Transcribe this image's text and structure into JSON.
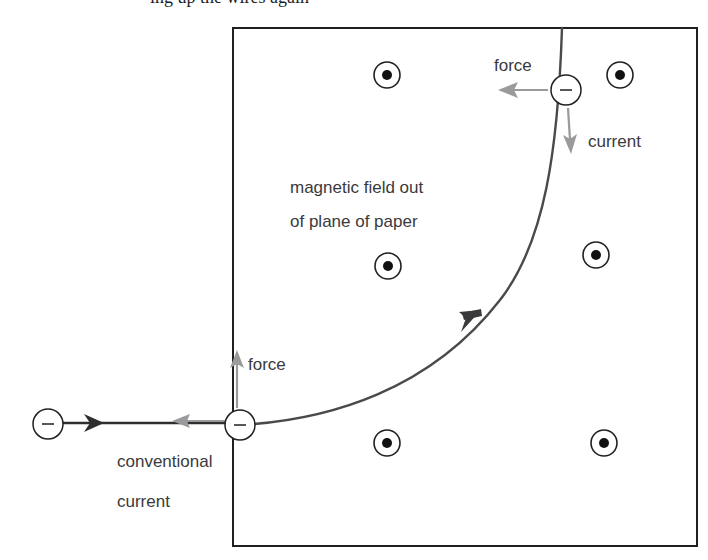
{
  "figure": {
    "kind": "physics-diagram",
    "background_color": "#ffffff",
    "clipped_top_text": "ing up the wires again"
  },
  "field_region": {
    "name": "magnetic-field-box",
    "border_color": "#231f20",
    "border_width": 2,
    "x": 233,
    "y": 28,
    "width": 464,
    "height": 518,
    "label_line_1": "magnetic field out",
    "label_line_2": "of plane of paper",
    "label_x": 290,
    "label_y": 178
  },
  "field_symbol": {
    "name": "field-out-of-page-dot",
    "outer_radius": 13,
    "inner_radius": 5,
    "outer_color": "#231f20",
    "inner_color": "#111111",
    "markers": [
      {
        "id": "dot-top-left",
        "cx": 387,
        "cy": 75
      },
      {
        "id": "dot-top-right",
        "cx": 620,
        "cy": 75
      },
      {
        "id": "dot-mid-left",
        "cx": 388,
        "cy": 266
      },
      {
        "id": "dot-mid-right",
        "cx": 596,
        "cy": 255
      },
      {
        "id": "dot-bottom-left",
        "cx": 387,
        "cy": 443
      },
      {
        "id": "dot-bottom-right",
        "cx": 604,
        "cy": 443
      }
    ]
  },
  "charges": {
    "symbol": "−",
    "radius": 15,
    "stroke_color": "#231f20",
    "fill_color": "#ffffff",
    "items": [
      {
        "id": "charge-left-outside",
        "cx": 48,
        "cy": 424,
        "label": "−"
      },
      {
        "id": "charge-entry",
        "cx": 240,
        "cy": 425,
        "label": "−"
      },
      {
        "id": "charge-exit-top",
        "cx": 566,
        "cy": 90,
        "label": "−"
      }
    ]
  },
  "electron_path": {
    "name": "curved-electron-trajectory",
    "color": "#4a4a4c",
    "width": 2.4,
    "description": "electron enters at left, curves upward and exits through the top of the field region",
    "direction_arrow": {
      "x": 468,
      "y": 318,
      "angle_deg": -48,
      "color": "#3a3a3c"
    }
  },
  "wire": {
    "name": "incoming-wire",
    "color": "#2e2e30",
    "width": 2.4,
    "x_start": 63,
    "x_end": 240,
    "y": 423
  },
  "arrows": {
    "conventional_current": {
      "id": "arrow-conventional-current",
      "color": "#2e2e30",
      "x": 100,
      "y": 423,
      "direction": "right"
    },
    "electron_velocity": {
      "id": "arrow-electron-velocity",
      "color": "#9a9a9c",
      "x": 176,
      "y": 421,
      "direction": "left"
    },
    "force_bottom": {
      "id": "arrow-force-bottom",
      "color": "#9a9a9c",
      "x": 237,
      "y": 355,
      "direction": "up"
    },
    "force_top": {
      "id": "arrow-force-top",
      "color": "#9a9a9c",
      "x": 500,
      "y": 90,
      "direction": "left"
    },
    "current_top": {
      "id": "arrow-current-top",
      "color": "#9a9a9c",
      "x": 570,
      "y": 150,
      "direction": "down"
    }
  },
  "labels": {
    "force_top": {
      "text": "force",
      "x": 494,
      "y": 56
    },
    "current_top": {
      "text": "current",
      "x": 588,
      "y": 132
    },
    "force_bottom": {
      "text": "force",
      "x": 248,
      "y": 355
    },
    "conventional_current_line1": {
      "text": "conventional",
      "x": 117,
      "y": 452
    },
    "conventional_current_line2": {
      "text": "current",
      "x": 117,
      "y": 492
    }
  }
}
